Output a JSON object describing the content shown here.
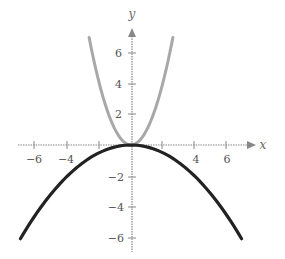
{
  "chart_data": {
    "type": "line",
    "title": "",
    "xlabel": "x",
    "ylabel": "y",
    "xlim": [
      -7,
      7
    ],
    "ylim": [
      -6.5,
      7
    ],
    "xticks": [
      -6,
      -4,
      -2,
      2,
      4,
      6
    ],
    "yticks": [
      -6,
      -4,
      -2,
      2,
      4,
      6
    ],
    "xtick_labels": [
      "−6",
      "−4",
      "4",
      "6"
    ],
    "ytick_labels": [
      "6",
      "4",
      "2",
      "−2",
      "−4",
      "−6"
    ],
    "grid": false,
    "legend": null,
    "series": [
      {
        "name": "y = x^2",
        "color": "#a8a8a8",
        "style": "light gray thick",
        "x": [
          -2.65,
          -2,
          -1.5,
          -1,
          -0.5,
          0,
          0.5,
          1,
          1.5,
          2,
          2.65
        ],
        "y": [
          7.02,
          4,
          2.25,
          1,
          0.25,
          0,
          0.25,
          1,
          2.25,
          4,
          7.02
        ]
      },
      {
        "name": "y = -(1/8)x^2",
        "color": "#222222",
        "style": "dark thick",
        "x": [
          -7,
          -6,
          -4,
          -2,
          0,
          2,
          4,
          6,
          7
        ],
        "y": [
          -6.125,
          -4.5,
          -2,
          -0.5,
          0,
          -0.5,
          -2,
          -4.5,
          -6.125
        ]
      }
    ]
  },
  "axes": {
    "x_label": "x",
    "y_label": "y",
    "x_tick_text": {
      "m6": "−6",
      "m4": "−4",
      "p4": "4",
      "p6": "6"
    },
    "y_tick_text": {
      "p6": "6",
      "p4": "4",
      "p2": "2",
      "m2": "−2",
      "m4": "−4",
      "m6": "−6"
    }
  }
}
